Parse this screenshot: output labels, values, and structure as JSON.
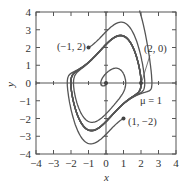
{
  "chart_data": {
    "type": "line",
    "title": "",
    "subtitle": "",
    "xlabel": "x",
    "ylabel": "y",
    "xlim": [
      -4,
      4
    ],
    "ylim": [
      -4,
      4
    ],
    "xticks": [
      -4,
      -3,
      -2,
      -1,
      0,
      1,
      2,
      3,
      4
    ],
    "yticks": [
      -4,
      -3,
      -2,
      -1,
      0,
      1,
      2,
      3,
      4
    ],
    "grid": false,
    "legend": null,
    "system": "van der Pol: x' = y, y' = mu(1 - x^2) y - x",
    "parameter": {
      "name": "μ",
      "value": 1
    },
    "series": [
      {
        "name": "trajectory from (-1, 2)",
        "start": [
          -1,
          2
        ],
        "t_end": 18
      },
      {
        "name": "trajectory from (2, 0)",
        "start": [
          2,
          0
        ],
        "t_end": 18
      },
      {
        "name": "trajectory from (1, -2)",
        "start": [
          1,
          -2
        ],
        "t_end": 18
      },
      {
        "name": "trajectory near origin (spiral out)",
        "start": [
          0.05,
          0.0
        ],
        "t_end": 24
      },
      {
        "name": "outer trajectory",
        "start": [
          -3.2,
          0.6
        ],
        "t_end": 12,
        "backward_start": [
          2.2,
          3.0
        ]
      }
    ],
    "annotations": [
      {
        "text": "(−1, 2)",
        "point": [
          -1,
          2
        ],
        "label_pos": [
          -3.0,
          2.0
        ]
      },
      {
        "text": "(2, 0)",
        "point": [
          2,
          0
        ],
        "label_pos": [
          1.9,
          1.8
        ]
      },
      {
        "text": "(1, −2)",
        "point": [
          1,
          -2
        ],
        "label_pos": [
          1.3,
          -2.0
        ]
      },
      {
        "text": "μ = 1",
        "point": null,
        "label_pos": [
          2.3,
          -1.1
        ]
      }
    ],
    "colors": {
      "curve": "#555555",
      "axis": "#555555",
      "text": "#333333",
      "background": "#ffffff"
    }
  },
  "labels": {
    "x_axis": "x",
    "y_axis": "y",
    "mu": "μ = 1",
    "p1": "(−1, 2)",
    "p2": "(2, 0)",
    "p3": "(1, −2)"
  }
}
